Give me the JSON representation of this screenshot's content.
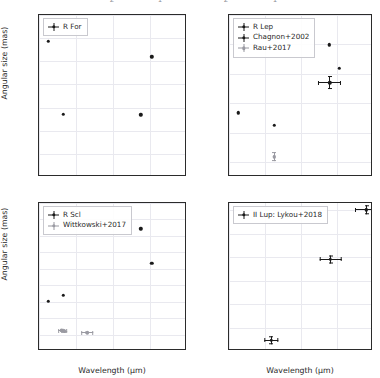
{
  "figure": {
    "width": 380,
    "height": 378,
    "background": "#ffffff",
    "grid_color": "#e9e9ef",
    "axis_color": "#2b2b2b",
    "marker_color": "#1a1a1a",
    "grey_marker_color": "#9a9aa2",
    "cropped_top_labels": [
      "2",
      "1",
      "2",
      "1"
    ]
  },
  "axis_titles": {
    "y": "Angular size (mas)",
    "x": "Wavelength (μm)"
  },
  "chart_data": [
    {
      "id": "r-for",
      "panel": "top-left",
      "type": "scatter",
      "title": "",
      "xlabel": "",
      "ylabel": "Angular size (mas)",
      "xlim": [
        1,
        5
      ],
      "ylim": [
        5,
        40
      ],
      "xticks": [
        1,
        2,
        3,
        4,
        5
      ],
      "yticks": [
        5,
        10,
        15,
        20,
        25,
        30,
        35,
        40
      ],
      "xticklabels": [
        "",
        "",
        "",
        "",
        ""
      ],
      "yticklabels": [
        "5",
        "10",
        "15",
        "20",
        "25",
        "30",
        "35",
        "40"
      ],
      "grid": true,
      "legend_position": "upper left",
      "series": [
        {
          "name": "R For",
          "color": "#1a1a1a",
          "marker": "errorbar-dot",
          "points": [
            {
              "x": 1.25,
              "y": 34.3,
              "xerr": 0,
              "yerr": 0
            },
            {
              "x": 1.65,
              "y": 18.6,
              "xerr": 0,
              "yerr": 0
            },
            {
              "x": 3.75,
              "y": 18.4,
              "xerr": 0,
              "yerr": 0
            },
            {
              "x": 4.05,
              "y": 31.0,
              "xerr": 0,
              "yerr": 0
            }
          ]
        }
      ]
    },
    {
      "id": "r-lep",
      "panel": "top-right",
      "type": "scatter",
      "title": "",
      "xlabel": "",
      "ylabel": "",
      "xlim": [
        1,
        5
      ],
      "ylim": [
        5,
        60
      ],
      "xticks": [
        1,
        2,
        3,
        4,
        5
      ],
      "yticks": [
        10,
        20,
        30,
        40,
        50,
        60
      ],
      "xticklabels": [
        "",
        "",
        "",
        "",
        ""
      ],
      "yticklabels": [
        "10",
        "20",
        "30",
        "40",
        "50",
        "60"
      ],
      "grid": true,
      "legend_position": "upper left",
      "series": [
        {
          "name": "R Lep",
          "color": "#1a1a1a",
          "marker": "errorbar-dot",
          "points": [
            {
              "x": 1.25,
              "y": 26.8,
              "xerr": 0,
              "yerr": 0
            },
            {
              "x": 2.25,
              "y": 22.6,
              "xerr": 0,
              "yerr": 0
            },
            {
              "x": 3.78,
              "y": 49.9,
              "xerr": 0,
              "yerr": 0
            },
            {
              "x": 4.07,
              "y": 41.9,
              "xerr": 0,
              "yerr": 0
            }
          ]
        },
        {
          "name": "Chagnon+2002",
          "color": "#1a1a1a",
          "marker": "errorbar-dot",
          "points": [
            {
              "x": 3.8,
              "y": 37.0,
              "xerr": 0.32,
              "yerr": 2.2
            }
          ]
        },
        {
          "name": "Rau+2017",
          "color": "#9a9aa2",
          "marker": "errorbar-dot",
          "points": [
            {
              "x": 2.25,
              "y": 11.9,
              "xerr": 0,
              "yerr": 1.5
            }
          ]
        }
      ]
    },
    {
      "id": "r-scl",
      "panel": "bottom-left",
      "type": "scatter",
      "title": "",
      "xlabel": "Wavelength (μm)",
      "ylabel": "Angular size (mas)",
      "xlim": [
        1,
        5
      ],
      "ylim": [
        5,
        50
      ],
      "xticks": [
        1,
        2,
        3,
        4,
        5
      ],
      "yticks": [
        5,
        10,
        15,
        20,
        25,
        30,
        35,
        40,
        45,
        50
      ],
      "xticklabels": [
        "1",
        "2",
        "3",
        "4",
        "5"
      ],
      "yticklabels": [
        "5",
        "10",
        "15",
        "20",
        "25",
        "30",
        "35",
        "40",
        "45",
        "50"
      ],
      "grid": true,
      "legend_position": "upper left",
      "series": [
        {
          "name": "R Scl",
          "color": "#1a1a1a",
          "marker": "errorbar-dot",
          "points": [
            {
              "x": 1.25,
              "y": 20.2,
              "xerr": 0,
              "yerr": 0
            },
            {
              "x": 1.65,
              "y": 22.0,
              "xerr": 0,
              "yerr": 0
            },
            {
              "x": 3.75,
              "y": 42.1,
              "xerr": 0,
              "yerr": 0
            },
            {
              "x": 4.05,
              "y": 31.6,
              "xerr": 0,
              "yerr": 0
            }
          ]
        },
        {
          "name": "Wittkowski+2017",
          "color": "#9a9aa2",
          "marker": "errorbar-dot",
          "points": [
            {
              "x": 1.62,
              "y": 11.2,
              "xerr": 0.09,
              "yerr": 0.5
            },
            {
              "x": 1.68,
              "y": 11.0,
              "xerr": 0.09,
              "yerr": 0.5
            },
            {
              "x": 2.3,
              "y": 10.5,
              "xerr": 0.17,
              "yerr": 0.3
            }
          ]
        }
      ]
    },
    {
      "id": "ii-lup",
      "panel": "bottom-right",
      "type": "scatter",
      "title": "",
      "xlabel": "Wavelength (μm)",
      "ylabel": "",
      "xlim": [
        1,
        5
      ],
      "ylim": [
        30,
        93
      ],
      "xticks": [
        1,
        2,
        3,
        4,
        5
      ],
      "yticks": [
        30,
        40,
        50,
        60,
        70,
        80,
        90
      ],
      "xticklabels": [
        "1",
        "2",
        "3",
        "4",
        "5"
      ],
      "yticklabels": [
        "30",
        "40",
        "50",
        "60",
        "70",
        "80",
        "90"
      ],
      "grid": true,
      "legend_position": "upper left",
      "series": [
        {
          "name": "II Lup: Lykou+2018",
          "color": "#1a1a1a",
          "marker": "errorbar-dot",
          "points": [
            {
              "x": 2.17,
              "y": 34.5,
              "xerr": 0.2,
              "yerr": 1.8
            },
            {
              "x": 3.82,
              "y": 69.0,
              "xerr": 0.3,
              "yerr": 1.7
            },
            {
              "x": 4.82,
              "y": 90.1,
              "xerr": 0.32,
              "yerr": 1.8
            }
          ]
        }
      ]
    }
  ]
}
